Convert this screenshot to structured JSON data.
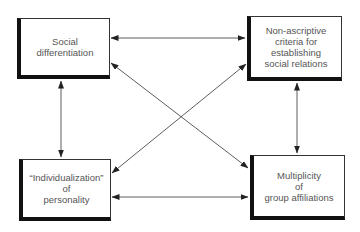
{
  "diagram": {
    "nodes": {
      "top_left": "Social\ndifferentiation",
      "top_right": "Non-ascriptive\ncriteria for\nestablishing\nsocial relations",
      "bottom_left": "“Individualization”\nof\npersonality",
      "bottom_right": "Multiplicity\nof\ngroup affiliations"
    },
    "edges": [
      {
        "from": "Social differentiation",
        "to": "Non-ascriptive criteria for establishing social relations",
        "type": "bidirectional"
      },
      {
        "from": "Social differentiation",
        "to": "“Individualization” of personality",
        "type": "bidirectional"
      },
      {
        "from": "Social differentiation",
        "to": "Multiplicity of group affiliations",
        "type": "bidirectional"
      },
      {
        "from": "Non-ascriptive criteria for establishing social relations",
        "to": "“Individualization” of personality",
        "type": "bidirectional"
      },
      {
        "from": "Non-ascriptive criteria for establishing social relations",
        "to": "Multiplicity of group affiliations",
        "type": "bidirectional"
      },
      {
        "from": "“Individualization” of personality",
        "to": "Multiplicity of group affiliations",
        "type": "bidirectional"
      }
    ],
    "colors": {
      "line": "#333333",
      "border": "#111111",
      "text": "#555555"
    }
  }
}
